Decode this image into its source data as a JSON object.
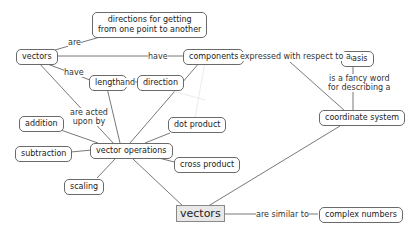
{
  "diagram": {
    "type": "concept-map",
    "nodes": {
      "directions": "directions for getting\nfrom one point to another",
      "vectors_top": "vectors",
      "components": "components",
      "basis": "basis",
      "length": "length",
      "direction": "direction",
      "coordinate_system": "coordinate system",
      "addition": "addition",
      "dot_product": "dot product",
      "vector_operations": "vector operations",
      "subtraction": "subtraction",
      "cross_product": "cross product",
      "scaling": "scaling",
      "vectors_main": "vectors",
      "complex_numbers": "complex numbers"
    },
    "links": {
      "are": "are",
      "have_components": "have",
      "expressed": "expressed with respect to a",
      "have_length": "have",
      "and": "and",
      "fancy_word": "is a fancy word\nfor describing a",
      "acted_upon": "are acted\nupon by",
      "similar": "are similar to"
    }
  }
}
